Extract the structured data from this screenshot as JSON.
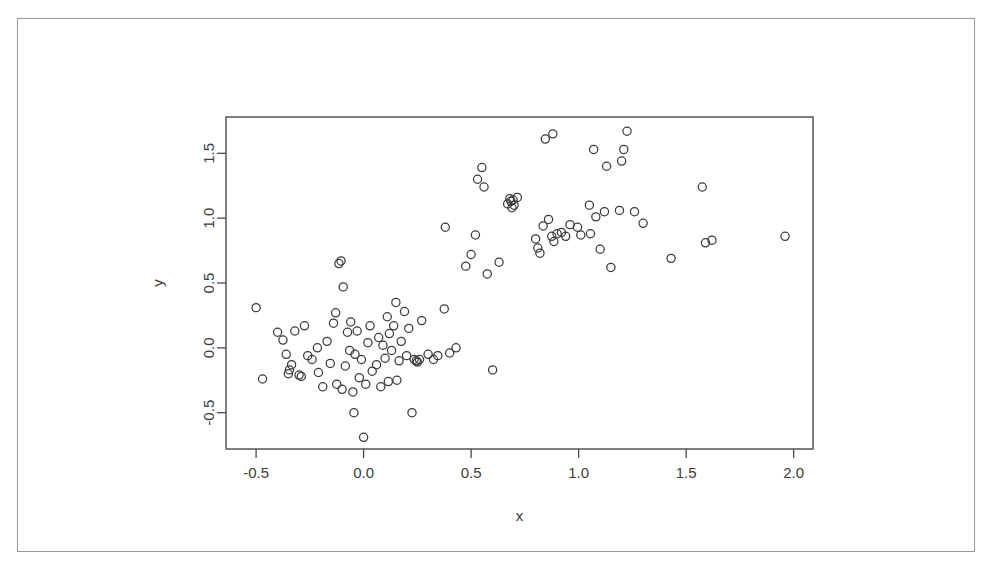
{
  "chart_data": {
    "type": "scatter",
    "title": "",
    "xlabel": "x",
    "ylabel": "y",
    "xlim": [
      -0.64,
      2.09
    ],
    "ylim": [
      -0.78,
      1.78
    ],
    "xticks": [
      -0.5,
      0.0,
      0.5,
      1.0,
      1.5,
      2.0
    ],
    "xtick_labels": [
      "-0.5",
      "0.0",
      "0.5",
      "1.0",
      "1.5",
      "2.0"
    ],
    "yticks": [
      -0.5,
      0.0,
      0.5,
      1.0,
      1.5
    ],
    "ytick_labels": [
      "-0.5",
      "0.0",
      "0.5",
      "1.0",
      "1.5"
    ],
    "grid": false,
    "legend": null,
    "marker": "open-circle",
    "marker_color": "#3a3a3a",
    "marker_size": 5,
    "n_points": 110,
    "points": [
      [
        -0.5,
        0.31
      ],
      [
        -0.47,
        -0.24
      ],
      [
        -0.4,
        0.12
      ],
      [
        -0.375,
        0.06
      ],
      [
        -0.36,
        -0.05
      ],
      [
        -0.35,
        -0.2
      ],
      [
        -0.345,
        -0.17
      ],
      [
        -0.335,
        -0.13
      ],
      [
        -0.32,
        0.13
      ],
      [
        -0.3,
        -0.21
      ],
      [
        -0.29,
        -0.22
      ],
      [
        -0.275,
        0.17
      ],
      [
        -0.26,
        -0.06
      ],
      [
        -0.24,
        -0.09
      ],
      [
        -0.215,
        0.0
      ],
      [
        -0.21,
        -0.19
      ],
      [
        -0.19,
        -0.3
      ],
      [
        -0.17,
        0.05
      ],
      [
        -0.155,
        -0.12
      ],
      [
        -0.14,
        0.19
      ],
      [
        -0.13,
        0.27
      ],
      [
        -0.125,
        -0.28
      ],
      [
        -0.115,
        0.65
      ],
      [
        -0.105,
        0.67
      ],
      [
        -0.1,
        -0.32
      ],
      [
        -0.095,
        0.47
      ],
      [
        -0.085,
        -0.14
      ],
      [
        -0.075,
        0.12
      ],
      [
        -0.065,
        -0.02
      ],
      [
        -0.06,
        0.2
      ],
      [
        -0.05,
        -0.34
      ],
      [
        -0.045,
        -0.5
      ],
      [
        -0.04,
        -0.05
      ],
      [
        -0.03,
        0.13
      ],
      [
        -0.02,
        -0.23
      ],
      [
        -0.01,
        -0.09
      ],
      [
        0.0,
        -0.69
      ],
      [
        0.01,
        -0.28
      ],
      [
        0.02,
        0.04
      ],
      [
        0.03,
        0.17
      ],
      [
        0.04,
        -0.18
      ],
      [
        0.06,
        -0.13
      ],
      [
        0.07,
        0.08
      ],
      [
        0.08,
        -0.3
      ],
      [
        0.09,
        0.02
      ],
      [
        0.1,
        -0.08
      ],
      [
        0.11,
        0.24
      ],
      [
        0.115,
        -0.26
      ],
      [
        0.12,
        0.11
      ],
      [
        0.13,
        -0.02
      ],
      [
        0.14,
        0.17
      ],
      [
        0.15,
        0.35
      ],
      [
        0.155,
        -0.25
      ],
      [
        0.165,
        -0.1
      ],
      [
        0.175,
        0.05
      ],
      [
        0.19,
        0.28
      ],
      [
        0.2,
        -0.06
      ],
      [
        0.21,
        0.15
      ],
      [
        0.225,
        -0.5
      ],
      [
        0.235,
        -0.09
      ],
      [
        0.245,
        -0.1
      ],
      [
        0.25,
        -0.11
      ],
      [
        0.26,
        -0.09
      ],
      [
        0.27,
        0.21
      ],
      [
        0.3,
        -0.05
      ],
      [
        0.325,
        -0.09
      ],
      [
        0.345,
        -0.06
      ],
      [
        0.375,
        0.3
      ],
      [
        0.38,
        0.93
      ],
      [
        0.4,
        -0.04
      ],
      [
        0.43,
        0.0
      ],
      [
        0.475,
        0.63
      ],
      [
        0.5,
        0.72
      ],
      [
        0.52,
        0.87
      ],
      [
        0.53,
        1.3
      ],
      [
        0.55,
        1.39
      ],
      [
        0.56,
        1.24
      ],
      [
        0.575,
        0.57
      ],
      [
        0.6,
        -0.17
      ],
      [
        0.63,
        0.66
      ],
      [
        0.67,
        1.11
      ],
      [
        0.68,
        1.15
      ],
      [
        0.685,
        1.13
      ],
      [
        0.69,
        1.08
      ],
      [
        0.695,
        1.14
      ],
      [
        0.7,
        1.1
      ],
      [
        0.715,
        1.16
      ],
      [
        0.8,
        0.84
      ],
      [
        0.81,
        0.77
      ],
      [
        0.82,
        0.73
      ],
      [
        0.835,
        0.94
      ],
      [
        0.845,
        1.61
      ],
      [
        0.86,
        0.99
      ],
      [
        0.875,
        0.86
      ],
      [
        0.88,
        1.65
      ],
      [
        0.885,
        0.82
      ],
      [
        0.9,
        0.88
      ],
      [
        0.92,
        0.89
      ],
      [
        0.94,
        0.86
      ],
      [
        0.96,
        0.95
      ],
      [
        0.995,
        0.93
      ],
      [
        1.01,
        0.87
      ],
      [
        1.05,
        1.1
      ],
      [
        1.055,
        0.88
      ],
      [
        1.07,
        1.53
      ],
      [
        1.08,
        1.01
      ],
      [
        1.1,
        0.76
      ],
      [
        1.12,
        1.05
      ],
      [
        1.13,
        1.4
      ],
      [
        1.15,
        0.62
      ],
      [
        1.19,
        1.06
      ],
      [
        1.2,
        1.44
      ],
      [
        1.21,
        1.53
      ],
      [
        1.225,
        1.67
      ],
      [
        1.26,
        1.05
      ],
      [
        1.3,
        0.96
      ],
      [
        1.43,
        0.69
      ],
      [
        1.575,
        1.24
      ],
      [
        1.59,
        0.81
      ],
      [
        1.62,
        0.83
      ],
      [
        1.96,
        0.86
      ]
    ]
  }
}
